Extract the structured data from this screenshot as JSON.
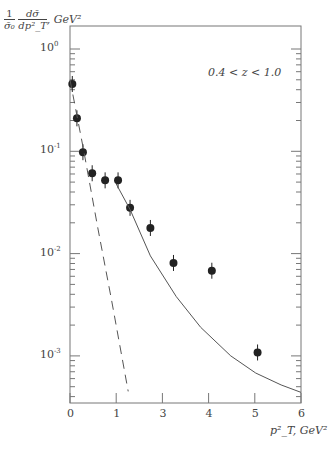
{
  "chart_data": {
    "type": "scatter",
    "title": "",
    "annotation": "0.4  < z <  1.0",
    "xlabel": "p_T^2, GeV^2",
    "ylabel": "1/σ0 dσ/dp_T^2, GeV^2",
    "ylabel_parts": {
      "num1": "1",
      "den1": "σ̄₀",
      "num2": "dσ̄",
      "den2": "dp²_T",
      "unit": ", GeV²"
    },
    "xlabel_text": "p²_T, GeV²",
    "x_ticks": [
      "0",
      "1",
      "3",
      "4",
      "5",
      "6"
    ],
    "x_tick_note": "Tick labels as printed in figure (second-to-left major tick labeled '3')",
    "xlim": [
      0,
      6
    ],
    "yscale": "log",
    "ylim": [
      0.0004,
      2.0
    ],
    "y_ticks": [
      "10^0",
      "10^-1",
      "10^-2",
      "10^-3"
    ],
    "y_tick_values": [
      1,
      0.1,
      0.01,
      0.001
    ],
    "grid": false,
    "series": [
      {
        "name": "data",
        "kind": "points_with_errorbars",
        "x": [
          0.05,
          0.15,
          0.28,
          0.48,
          0.76,
          1.04,
          1.3,
          1.74,
          2.24,
          3.07,
          4.06
        ],
        "y": [
          0.455,
          0.21,
          0.098,
          0.061,
          0.052,
          0.052,
          0.028,
          0.0178,
          0.0081,
          0.0068,
          0.00108
        ]
      },
      {
        "name": "dashed-curve",
        "kind": "line_dashed",
        "x": [
          0.0,
          0.3,
          0.6,
          0.9,
          1.26
        ],
        "y": [
          0.5,
          0.1,
          0.018,
          0.0035,
          0.00045
        ]
      },
      {
        "name": "solid-curve",
        "kind": "line",
        "x": [
          1.0,
          1.3,
          1.74,
          2.3,
          2.83,
          3.48,
          4.02,
          4.57,
          5.0
        ],
        "y": [
          0.048,
          0.027,
          0.0095,
          0.0038,
          0.0019,
          0.001,
          0.00068,
          0.00052,
          0.00044
        ]
      }
    ]
  }
}
